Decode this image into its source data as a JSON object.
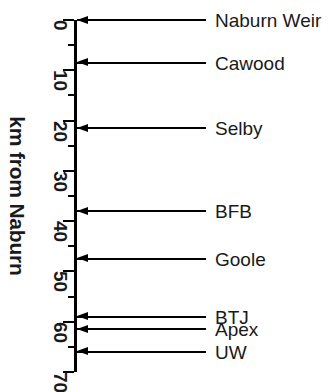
{
  "figure": {
    "type": "annotated-axis-diagram",
    "background_color": "#ffffff",
    "line_color": "#000000"
  },
  "axis": {
    "title": "km from Naburn",
    "orientation": "vertical",
    "direction": "downward-increasing",
    "min": 0,
    "max": 70,
    "major_tick_interval": 10,
    "minor_tick_interval": 5,
    "major_ticks": [
      {
        "value": 0,
        "label": "0"
      },
      {
        "value": 10,
        "label": "10"
      },
      {
        "value": 20,
        "label": "20"
      },
      {
        "value": 30,
        "label": "30"
      },
      {
        "value": 40,
        "label": "40"
      },
      {
        "value": 50,
        "label": "50"
      },
      {
        "value": 60,
        "label": "60"
      },
      {
        "value": 70,
        "label": "70"
      }
    ],
    "minor_ticks": [
      5,
      15,
      25,
      35,
      45,
      55,
      65
    ]
  },
  "chart_data": {
    "type": "scatter",
    "title": "",
    "xlabel": "",
    "ylabel": "km from Naburn",
    "ylim": [
      0,
      70
    ],
    "categories": [
      "Naburn Weir",
      "Cawood",
      "Selby",
      "BFB",
      "Goole",
      "BTJ",
      "Apex",
      "UW"
    ],
    "values": [
      0,
      8.5,
      21.5,
      38,
      47.5,
      59,
      61.5,
      66
    ],
    "grid": false,
    "legend": "none"
  },
  "sites": [
    {
      "name": "Naburn Weir",
      "km": 0,
      "label": "Naburn Weir"
    },
    {
      "name": "Cawood",
      "km": 8.5,
      "label": "Cawood"
    },
    {
      "name": "Selby",
      "km": 21.5,
      "label": "Selby"
    },
    {
      "name": "BFB",
      "km": 38,
      "label": "BFB"
    },
    {
      "name": "Goole",
      "km": 47.5,
      "label": "Goole"
    },
    {
      "name": "BTJ",
      "km": 59,
      "label": "BTJ"
    },
    {
      "name": "Apex",
      "km": 61.5,
      "label": "Apex"
    },
    {
      "name": "UW",
      "km": 66,
      "label": "UW"
    }
  ]
}
